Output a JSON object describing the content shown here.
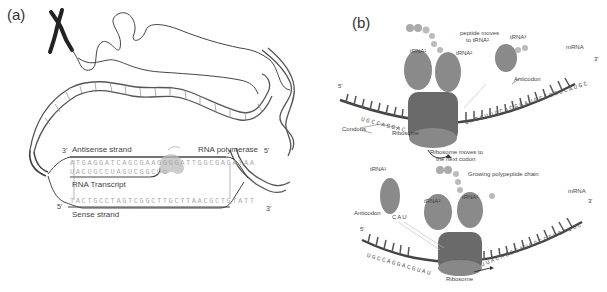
{
  "panels": {
    "a": {
      "label": "(a)",
      "antisense_label": "Antisense strand",
      "polymerase_label": "RNA polymerase",
      "transcript_label": "RNA Transcript",
      "sense_label": "Sense strand",
      "antisense_3": "3'",
      "antisense_5": "5'",
      "sense_5": "5'",
      "sense_3": "3'",
      "antisense_seq": "ATGAGGATCAGCGAAGGGGATTGGCGACATAA",
      "transcript_seq": "UACUGCCUAGUCGGCUU",
      "sense_seq": "TACTGCCTAGTCGGCTTGCTTAACGCTGTATT"
    },
    "b": {
      "label": "(b)",
      "top": {
        "peptide_moves": "peptide moves",
        "peptide_moves_2": "to tRNA²",
        "trna1": "tRNA¹",
        "trna2": "tRNA²",
        "trna3": "tRNA³",
        "mrna": "mRNA",
        "anticodon": "Anticodon",
        "codons": "Condons",
        "ribosome": "Ribosome",
        "ribosome_moves": "Ribosome moves to",
        "ribosome_moves_2": "the next codon",
        "five_prime": "5'",
        "three_prime": "3'",
        "mrna_seq_left": "UGCCAGGAC",
        "mrna_seq_mid": "GUAUGG",
        "mrna_seq_right": "GAGCUUACACGGAUGGCCGUCAUGC"
      },
      "bottom": {
        "trna1": "tRNA¹",
        "trna2": "tRNA²",
        "trna3": "tRNA³",
        "growing_chain": "Growing polypeptide chain",
        "anticodon": "Anticodon",
        "anticodon_seq": "CAU",
        "mrna": "mRNA",
        "ribosome": "Ribosome",
        "five_prime": "5'",
        "three_prime": "3'",
        "mrna_seq_left": "UGCCAGGACGUAU",
        "mrna_seq_right": "UUACACGGAUGGCCGUCAUGC"
      }
    }
  },
  "colors": {
    "strand": "#555555",
    "base_light": "#b0b0b0",
    "trna": "#8a8a8a",
    "ribosome": "#6a6a6a",
    "mrna_backbone": "#444444"
  }
}
